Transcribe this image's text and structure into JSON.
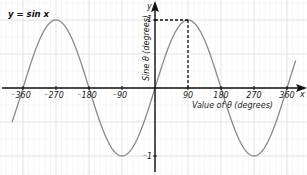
{
  "chart_data": {
    "type": "line",
    "title": "y = sin x",
    "xlabel": "Value of θ (degrees)",
    "ylabel": "Sine θ (degrees)",
    "x_axis_letter": "x",
    "y_axis_letter": "y",
    "xlim": [
      -380,
      380
    ],
    "ylim": [
      -1.1,
      1.1
    ],
    "x_ticks": [
      -360,
      -270,
      -180,
      -90,
      90,
      180,
      270,
      360
    ],
    "x_tick_labels": [
      "-360",
      "-270",
      "-180",
      "-90",
      "90",
      "180",
      "270",
      "360"
    ],
    "y_ticks": [
      1,
      -1
    ],
    "y_tick_labels": [
      "1",
      "-1"
    ],
    "grid": true,
    "series": [
      {
        "name": "y = sin x",
        "color": "#8a8a8a",
        "x": [
          -380,
          -360,
          -315,
          -270,
          -225,
          -180,
          -135,
          -90,
          -45,
          0,
          45,
          90,
          135,
          180,
          225,
          270,
          315,
          360,
          380
        ],
        "y": [
          -0.34,
          0,
          0.71,
          1,
          0.71,
          0,
          -0.71,
          -1,
          -0.71,
          0,
          0.71,
          1,
          0.71,
          0,
          -0.71,
          -1,
          -0.71,
          0,
          0.34
        ]
      }
    ],
    "annotations": [
      {
        "type": "dashed-guide",
        "point": [
          90,
          1
        ],
        "description": "dashed lines from (90,1) to both axes"
      }
    ]
  }
}
